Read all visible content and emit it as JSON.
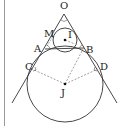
{
  "diagram": {
    "type": "geometry",
    "colors": {
      "stroke": "#333333",
      "dashed": "#777777",
      "border": "#9a9a9a"
    },
    "labels": {
      "O": "O",
      "M": "M",
      "I": "I",
      "A": "A",
      "B": "B",
      "C": "C",
      "D": "D",
      "J": "J"
    },
    "points": {
      "O": [
        64,
        14
      ],
      "I": [
        65,
        40
      ],
      "J": [
        65,
        84
      ],
      "A": [
        45,
        48
      ],
      "B": [
        84,
        48
      ],
      "C": [
        32,
        68
      ],
      "D": [
        98,
        68
      ],
      "M": [
        55,
        36
      ]
    },
    "circles": [
      {
        "name": "small-circle",
        "center": "I",
        "r": 12
      },
      {
        "name": "large-circle",
        "center": "J",
        "r": 38
      }
    ]
  }
}
